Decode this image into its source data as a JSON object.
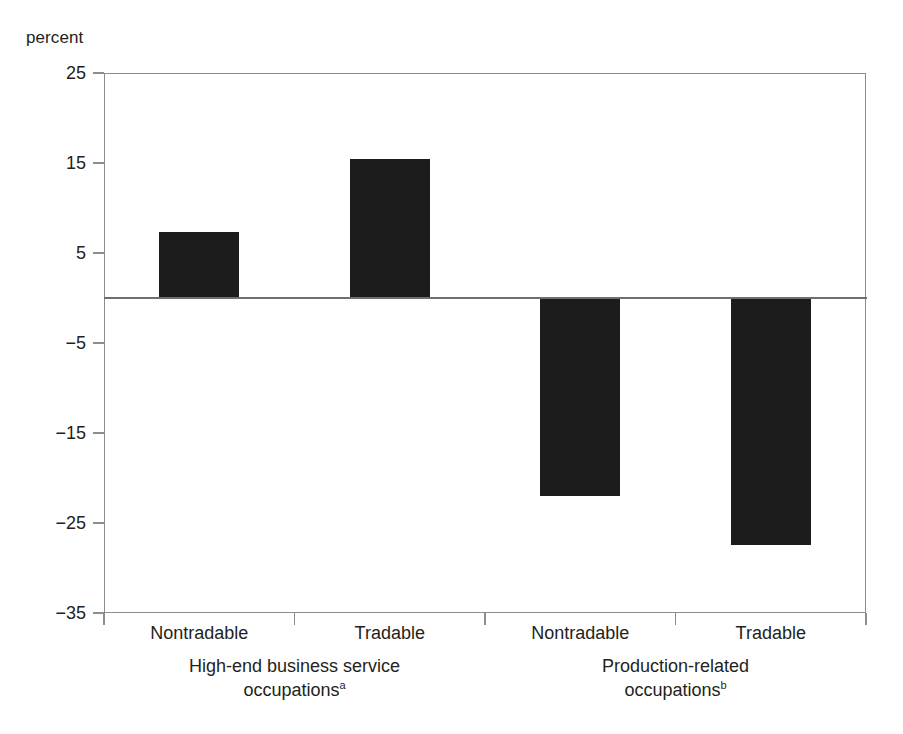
{
  "chart_data": {
    "type": "bar",
    "title": "",
    "subtitle": "",
    "xlabel": "",
    "ylabel": "percent",
    "ylim": [
      -35,
      25
    ],
    "yticks": [
      25,
      15,
      5,
      -5,
      -15,
      -25,
      -35
    ],
    "ytick_labels": [
      "25",
      "15",
      "5",
      "−5",
      "−15",
      "−25",
      "−35"
    ],
    "grid": false,
    "legend": false,
    "legend_position": "none",
    "zero_line": 0,
    "bar_color": "#1c1c1c",
    "axis_color": "#8d8d8d",
    "categories": [
      "Nontradable",
      "Tradable",
      "Nontradable",
      "Tradable"
    ],
    "values": [
      7.3,
      15.4,
      -22.0,
      -27.4
    ],
    "groups": [
      {
        "label_line1": "High-end business service",
        "label_line2": "occupations",
        "footnote_marker": "a",
        "categories": [
          "Nontradable",
          "Tradable"
        ],
        "values": [
          7.3,
          15.4
        ]
      },
      {
        "label_line1": "Production-related",
        "label_line2": "occupations",
        "footnote_marker": "b",
        "categories": [
          "Nontradable",
          "Tradable"
        ],
        "values": [
          -22.0,
          -27.4
        ]
      }
    ]
  },
  "axis": {
    "unit_label": "percent"
  }
}
